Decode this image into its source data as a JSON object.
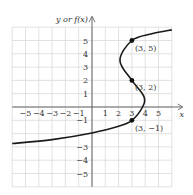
{
  "chart_data": {
    "type": "line",
    "title": "",
    "xlabel": "x",
    "ylabel": "y or f(x)",
    "xlim": [
      -6,
      6
    ],
    "ylim": [
      -6,
      6
    ],
    "grid": true,
    "x_ticks": [
      "-5",
      "-4",
      "-3",
      "-2",
      "-1",
      "1",
      "2",
      "3",
      "4",
      "5"
    ],
    "y_ticks": [
      "5",
      "4",
      "3",
      "2",
      "1",
      "-1",
      "-3",
      "-4",
      "-5"
    ],
    "series": [
      {
        "name": "curve",
        "points": [
          [
            -6,
            -2.75
          ],
          [
            -3,
            -2.45
          ],
          [
            0,
            -1.95
          ],
          [
            2,
            -1.45
          ],
          [
            3,
            -1
          ],
          [
            3.8,
            0
          ],
          [
            3.9,
            0.8
          ],
          [
            3,
            2
          ],
          [
            2.1,
            3.5
          ],
          [
            3,
            5
          ],
          [
            4.5,
            5.5
          ],
          [
            6,
            5.8
          ]
        ]
      }
    ],
    "annotations": [
      {
        "label": "(3, 5)",
        "x": 3,
        "y": 5
      },
      {
        "label": "(3, 2)",
        "x": 3,
        "y": 2
      },
      {
        "label": "(3, −1)",
        "x": 3,
        "y": -1
      }
    ]
  }
}
